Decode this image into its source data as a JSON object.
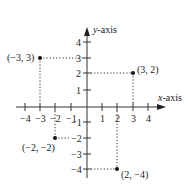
{
  "diagram": {
    "type": "cartesian-coordinate-plane",
    "x_axis_label": "x-axis",
    "y_axis_label": "y-axis",
    "x_ticks": [
      "−4",
      "−3",
      "−2",
      "−1",
      "1",
      "2",
      "3",
      "4"
    ],
    "y_ticks": [
      "4",
      "3",
      "2",
      "1",
      "−1",
      "−2",
      "−3",
      "−4"
    ],
    "points": [
      {
        "label": "(−3, 3)",
        "x": -3,
        "y": 3
      },
      {
        "label": "(3, 2)",
        "x": 3,
        "y": 2
      },
      {
        "label": "(−2, −2)",
        "x": -2,
        "y": -2
      },
      {
        "label": "(2, −4)",
        "x": 2,
        "y": -4
      }
    ],
    "colors": {
      "axis": "#333333",
      "point": "#111111",
      "guide": "#333333"
    }
  }
}
